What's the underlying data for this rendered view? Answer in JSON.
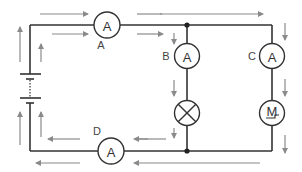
{
  "diagram": {
    "type": "circuit",
    "components": {
      "ammeter_a": {
        "symbol": "A",
        "label": "A"
      },
      "ammeter_b": {
        "symbol": "A",
        "label": "B"
      },
      "ammeter_c": {
        "symbol": "A",
        "label": "C"
      },
      "ammeter_d": {
        "symbol": "A",
        "label": "D"
      },
      "lamp": {
        "symbol": "lamp-cross"
      },
      "motor": {
        "symbol": "M"
      },
      "battery": {
        "symbol": "battery-cells"
      }
    },
    "colors": {
      "wire": "#333333",
      "current_arrow": "#8a8a8a"
    }
  }
}
